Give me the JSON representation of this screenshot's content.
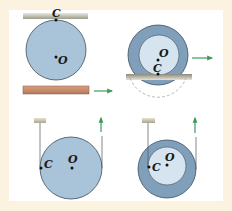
{
  "colors": {
    "frame": "#fbf3df",
    "panel": "#ffffff",
    "disk_fill": "#a9c3d8",
    "disk_dark": "#7f9fba",
    "disk_light": "#d6e4ef",
    "disk_stroke": "#3e4f5e",
    "arrow": "#3c9a5a",
    "upper_bar": "#c9c9bc",
    "lower_bar": "#c78e6f",
    "ground": "#b4b09c"
  },
  "figures": [
    {
      "id": "disk-between-plates",
      "labels": {
        "contact": "C",
        "center": "O"
      },
      "arrow_direction": "right"
    },
    {
      "id": "wheel-rolling-on-ground",
      "labels": {
        "contact": "C",
        "center": "O"
      },
      "arrow_direction": "right"
    },
    {
      "id": "disk-hanging-by-string",
      "labels": {
        "contact": "C",
        "center": "O"
      },
      "arrow_direction": "up"
    },
    {
      "id": "spool-hanging-by-string",
      "labels": {
        "contact": "C",
        "center": "O"
      },
      "arrow_direction": "up"
    }
  ]
}
